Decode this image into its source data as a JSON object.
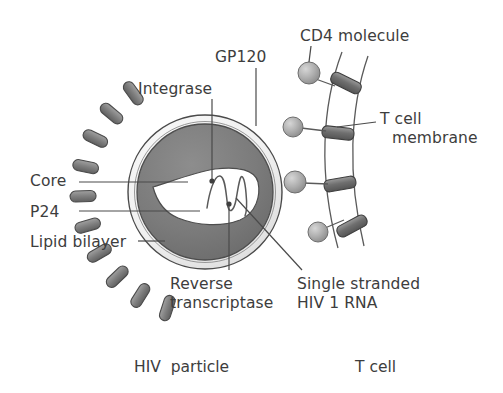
{
  "figure": {
    "type": "biological-diagram",
    "background_color": "#ffffff",
    "text_color": "#3d3d3d"
  },
  "labels": {
    "cd4_molecule": "CD4 molecule",
    "gp120": "GP120",
    "integrase": "Integrase",
    "t_cell_membrane_line1": "T cell",
    "t_cell_membrane_line2": "membrane",
    "core": "Core",
    "p24": "P24",
    "lipid_bilayer": "Lipid bilayer",
    "reverse_transcriptase_line1": "Reverse",
    "reverse_transcriptase_line2": "transcriptase",
    "single_stranded_rna_line1": "Single stranded",
    "single_stranded_rna_line2": "HIV 1 RNA"
  },
  "captions": {
    "left": "HIV  particle",
    "right": "T cell"
  },
  "colors": {
    "outline": "#4a4a4a",
    "envelope_light": "#f2f2f2",
    "core_gray": "#7d7d7d",
    "capsid_white": "#ffffff",
    "spike_gray": "#808080",
    "spike_outline": "#4a4a4a",
    "cd4_sphere": "#a8a8a8",
    "membrane_bar": "#6e6e6e",
    "leader_line": "#4a4a4a"
  },
  "structures": {
    "hiv_particle": {
      "name": "HIV particle",
      "center": [
        205,
        192
      ],
      "outer_radius": 78,
      "parts": [
        "lipid bilayer (outer light ring)",
        "core / matrix (dark gray annulus)",
        "capsid cone (white, P24)",
        "single stranded HIV 1 RNA (squiggle)",
        "integrase (dot on capsid)",
        "reverse transcriptase (dot on RNA)",
        "GP120 spikes (dark capsules on right surface)"
      ],
      "gp120_spike_count": 10
    },
    "t_cell": {
      "name": "T cell",
      "membrane": "two curved arcs with slanted transmembrane bars",
      "cd4_count": 4,
      "cd4_positions": [
        [
          309,
          73
        ],
        [
          293,
          127
        ],
        [
          295,
          182
        ],
        [
          318,
          232
        ]
      ]
    }
  }
}
